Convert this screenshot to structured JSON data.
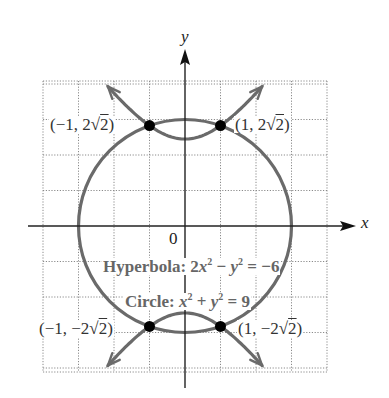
{
  "figure": {
    "axes": {
      "x_label": "x",
      "y_label": "y",
      "origin_label": "0"
    },
    "labels": {
      "hyperbola_prefix": "Hyperbola: ",
      "hyperbola_c1": "2",
      "hyperbola_v1": "x",
      "hyperbola_e1": "2",
      "hyperbola_mid": " − ",
      "hyperbola_v2": "y",
      "hyperbola_e2": "2",
      "hyperbola_rhs": " = −6",
      "circle_prefix": "Circle: ",
      "circle_v1": "x",
      "circle_e1": "2",
      "circle_mid": " + ",
      "circle_v2": "y",
      "circle_e2": "2",
      "circle_rhs": " = 9"
    },
    "points": [
      {
        "name": "top-left",
        "pre": "(−1, 2√",
        "rad": "2",
        "post": ")",
        "x": -1,
        "y": 2.828
      },
      {
        "name": "top-right",
        "pre": "(1, 2√",
        "rad": "2",
        "post": ")",
        "x": 1,
        "y": 2.828
      },
      {
        "name": "bottom-left",
        "pre": "(−1, −2√",
        "rad": "2",
        "post": ")",
        "x": -1,
        "y": -2.828
      },
      {
        "name": "bottom-right",
        "pre": "(1, −2√",
        "rad": "2",
        "post": ")",
        "x": 1,
        "y": -2.828
      }
    ],
    "colors": {
      "curve": "#6a6a6a",
      "label": "#666666",
      "point": "#000000",
      "grid": "#8a8a8a"
    },
    "grid": {
      "x_range": [
        -4,
        4
      ],
      "y_range": [
        -4,
        4
      ],
      "step": 1
    },
    "curves": [
      {
        "type": "circle",
        "equation": "x^2 + y^2 = 9",
        "radius": 3
      },
      {
        "type": "hyperbola",
        "equation": "2x^2 - y^2 = -6"
      }
    ]
  }
}
